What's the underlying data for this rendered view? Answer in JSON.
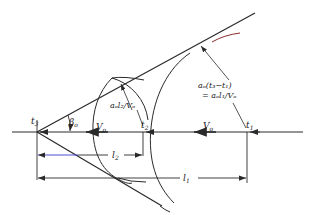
{
  "diagram": {
    "type": "mach-cone-wavefront-construction",
    "colors": {
      "line": "#2a2a2a",
      "dimension_highlight": "#3a3acc",
      "tangent_tint": "#8b2a2a",
      "background": "#ffffff"
    },
    "points": {
      "t3": "t",
      "t3_sub": "3",
      "t2": "t",
      "t2_sub": "2",
      "t1": "t",
      "t1_sub": "1"
    },
    "angle_label": "β",
    "angle_sub": "o",
    "velocity_label_left": "V",
    "velocity_label_left_sub": "o",
    "velocity_label_right": "V",
    "velocity_label_right_sub": "o",
    "annotation_small": {
      "text": "a",
      "full": "aₒl₂/Vₒ"
    },
    "annotation_large": {
      "line1": "aₒ(t₃−t₁)",
      "line2": "= aₒl₁/Vₒ"
    },
    "dimensions": {
      "l2": "l",
      "l2_sub": "2",
      "l1": "l",
      "l1_sub": "1"
    }
  }
}
